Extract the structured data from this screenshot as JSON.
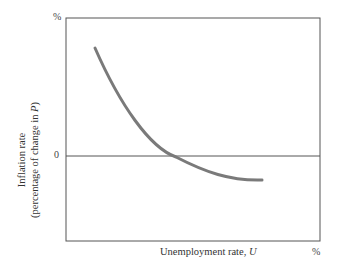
{
  "chart_data": {
    "type": "line",
    "title": "",
    "xlabel": "Unemployment rate, U",
    "ylabel": "Inflation rate (percentage of change in P)",
    "ylabel_line1": "Inflation rate",
    "ylabel_line2": "(percentage of change in P)",
    "x_unit_label": "%",
    "y_unit_label": "%",
    "y_zero_label": "0",
    "grid": false,
    "legend": null,
    "series": [
      {
        "name": "Phillips curve",
        "color": "#7a7a7a",
        "points_px": [
          [
            95,
            48
          ],
          [
            110,
            78
          ],
          [
            125,
            104
          ],
          [
            140,
            125
          ],
          [
            155,
            142
          ],
          [
            170,
            154
          ],
          [
            176,
            157
          ],
          [
            190,
            166
          ],
          [
            205,
            173
          ],
          [
            220,
            177
          ],
          [
            235,
            179
          ],
          [
            250,
            180
          ],
          [
            262,
            180
          ]
        ]
      }
    ],
    "frame_color": "#555555",
    "zero_line_color": "#555555"
  }
}
